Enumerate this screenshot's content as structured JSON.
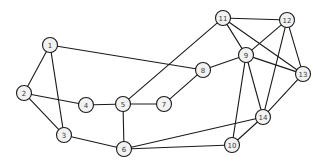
{
  "figure": {
    "type": "node-link-graph",
    "width": 326,
    "height": 168,
    "background_color": "#ffffff",
    "node_fill_color": "#f2f2f2",
    "node_stroke_color": "#1a1a1a",
    "edge_color": "#1a1a1a",
    "label_color": "#3a3a3a",
    "node_radius": 7.5,
    "node_count": 14,
    "edge_count": 25
  },
  "nodes": [
    {
      "id": "1",
      "label": "1",
      "x": 50,
      "y": 45
    },
    {
      "id": "2",
      "label": "2",
      "x": 24,
      "y": 93
    },
    {
      "id": "3",
      "label": "3",
      "x": 64,
      "y": 135
    },
    {
      "id": "4",
      "label": "4",
      "x": 86,
      "y": 105
    },
    {
      "id": "5",
      "label": "5",
      "x": 123,
      "y": 104
    },
    {
      "id": "6",
      "label": "6",
      "x": 124,
      "y": 149
    },
    {
      "id": "7",
      "label": "7",
      "x": 164,
      "y": 104
    },
    {
      "id": "8",
      "label": "8",
      "x": 203,
      "y": 70
    },
    {
      "id": "9",
      "label": "9",
      "x": 246,
      "y": 55
    },
    {
      "id": "10",
      "label": "10",
      "x": 232,
      "y": 145
    },
    {
      "id": "11",
      "label": "11",
      "x": 223,
      "y": 18
    },
    {
      "id": "12",
      "label": "12",
      "x": 287,
      "y": 20
    },
    {
      "id": "13",
      "label": "13",
      "x": 303,
      "y": 74
    },
    {
      "id": "14",
      "label": "14",
      "x": 263,
      "y": 117
    }
  ],
  "edges": [
    {
      "source": "1",
      "target": "2"
    },
    {
      "source": "1",
      "target": "3"
    },
    {
      "source": "1",
      "target": "8"
    },
    {
      "source": "2",
      "target": "3"
    },
    {
      "source": "2",
      "target": "4"
    },
    {
      "source": "3",
      "target": "6"
    },
    {
      "source": "4",
      "target": "5"
    },
    {
      "source": "5",
      "target": "6"
    },
    {
      "source": "5",
      "target": "7"
    },
    {
      "source": "5",
      "target": "11"
    },
    {
      "source": "6",
      "target": "10"
    },
    {
      "source": "6",
      "target": "14"
    },
    {
      "source": "7",
      "target": "8"
    },
    {
      "source": "8",
      "target": "9"
    },
    {
      "source": "9",
      "target": "10"
    },
    {
      "source": "9",
      "target": "11"
    },
    {
      "source": "9",
      "target": "12"
    },
    {
      "source": "9",
      "target": "13"
    },
    {
      "source": "9",
      "target": "14"
    },
    {
      "source": "10",
      "target": "14"
    },
    {
      "source": "11",
      "target": "12"
    },
    {
      "source": "11",
      "target": "13"
    },
    {
      "source": "12",
      "target": "13"
    },
    {
      "source": "12",
      "target": "14"
    },
    {
      "source": "13",
      "target": "14"
    }
  ],
  "chart_data": {
    "type": "graph",
    "title": "",
    "node_labels": [
      "1",
      "2",
      "3",
      "4",
      "5",
      "6",
      "7",
      "8",
      "9",
      "10",
      "11",
      "12",
      "13",
      "14"
    ],
    "adjacency": {
      "1": [
        "2",
        "3",
        "8"
      ],
      "2": [
        "1",
        "3",
        "4"
      ],
      "3": [
        "1",
        "2",
        "6"
      ],
      "4": [
        "2",
        "5"
      ],
      "5": [
        "4",
        "6",
        "7",
        "11"
      ],
      "6": [
        "3",
        "5",
        "10",
        "14"
      ],
      "7": [
        "5",
        "8"
      ],
      "8": [
        "1",
        "7",
        "9"
      ],
      "9": [
        "8",
        "10",
        "11",
        "12",
        "13",
        "14"
      ],
      "10": [
        "6",
        "9",
        "14"
      ],
      "11": [
        "5",
        "9",
        "12",
        "13"
      ],
      "12": [
        "9",
        "11",
        "13",
        "14"
      ],
      "13": [
        "9",
        "11",
        "12",
        "14"
      ],
      "14": [
        "6",
        "9",
        "10",
        "12",
        "13"
      ]
    },
    "degrees": {
      "1": 3,
      "2": 3,
      "3": 3,
      "4": 2,
      "5": 4,
      "6": 4,
      "7": 2,
      "8": 3,
      "9": 6,
      "10": 3,
      "11": 4,
      "12": 4,
      "13": 4,
      "14": 5
    },
    "directed": false,
    "weighted": false
  }
}
